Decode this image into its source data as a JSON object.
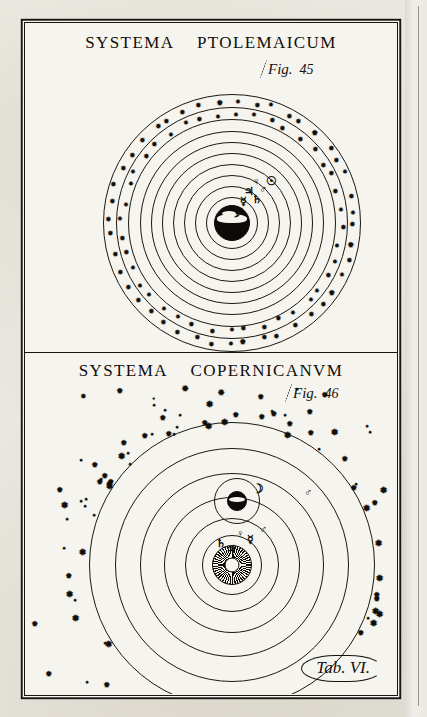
{
  "plate": {
    "tab_label": "Tab. VI."
  },
  "panels": [
    {
      "id": "ptolemaic",
      "title_word1": "SYSTEMA",
      "title_word2": "PTOLEMAICUM",
      "fig_prefix": "Fig.",
      "fig_number": "45",
      "center_body": "earth",
      "center_label": "Earth",
      "rings": [
        {
          "name": "luna-orbit",
          "r": 26
        },
        {
          "name": "mercury-orbit",
          "r": 37
        },
        {
          "name": "venus-orbit",
          "r": 48
        },
        {
          "name": "sol-orbit",
          "r": 59
        },
        {
          "name": "mars-orbit",
          "r": 70
        },
        {
          "name": "jupiter-orbit",
          "r": 81
        },
        {
          "name": "saturn-orbit",
          "r": 92
        },
        {
          "name": "zodiac-inner",
          "r": 104
        },
        {
          "name": "zodiac-mid",
          "r": 116
        },
        {
          "name": "firmament",
          "r": 129
        }
      ],
      "planets": [
        {
          "name": "saturn",
          "glyph": "♄",
          "size": 11,
          "x": 232,
          "y": 176
        },
        {
          "name": "jupiter",
          "glyph": "♃",
          "size": 11,
          "x": 224,
          "y": 168
        },
        {
          "name": "mars",
          "glyph": "♂",
          "size": 11,
          "x": 238,
          "y": 166
        },
        {
          "name": "sol",
          "glyph": "☉",
          "size": 12,
          "x": 246,
          "y": 158
        },
        {
          "name": "venus",
          "glyph": "♀",
          "size": 11,
          "x": 231,
          "y": 158
        },
        {
          "name": "mercury",
          "glyph": "☿",
          "size": 11,
          "x": 218,
          "y": 178
        },
        {
          "name": "luna",
          "glyph": "☽",
          "size": 12,
          "x": 210,
          "y": 190
        }
      ]
    },
    {
      "id": "copernican",
      "title_word1": "SYSTEMA",
      "title_word2": "COPERNICANVM",
      "fig_prefix": "Fig.",
      "fig_number": "46",
      "center_body": "sun",
      "center_label": "Sol",
      "rings": [
        {
          "name": "mercury-orbit",
          "r": 30
        },
        {
          "name": "venus-orbit",
          "r": 47
        },
        {
          "name": "earth-orbit",
          "r": 68
        },
        {
          "name": "mars-orbit",
          "r": 92
        },
        {
          "name": "jupiter-orbit",
          "r": 117
        },
        {
          "name": "saturn-orbit",
          "r": 143
        }
      ],
      "planets": [
        {
          "name": "mercury",
          "glyph": "☿",
          "size": 11,
          "x": 225,
          "y": 186
        },
        {
          "name": "venus",
          "glyph": "♀",
          "size": 11,
          "x": 215,
          "y": 180
        },
        {
          "name": "mars",
          "glyph": "♂",
          "size": 11,
          "x": 238,
          "y": 176
        },
        {
          "name": "jupiter",
          "glyph": "♃",
          "size": 11,
          "x": 206,
          "y": 196
        },
        {
          "name": "saturn",
          "glyph": "♄",
          "size": 11,
          "x": 196,
          "y": 190
        },
        {
          "name": "mars-outer",
          "glyph": "♂",
          "size": 11,
          "x": 283,
          "y": 139
        }
      ],
      "earth": {
        "name": "earth",
        "x": 212,
        "y": 148
      },
      "moon": {
        "name": "moon",
        "glyph": "☽",
        "x": 233,
        "y": 135
      }
    }
  ]
}
